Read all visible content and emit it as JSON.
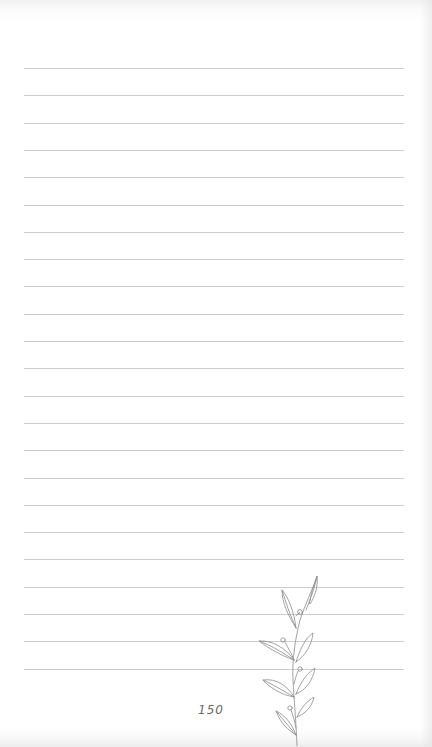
{
  "page": {
    "type": "lined-notebook-page",
    "background_color": "#ffffff",
    "rule_color": "#cdcdcd",
    "rule_count": 23,
    "page_number": "150",
    "decoration": "leaf-sprig-icon"
  }
}
